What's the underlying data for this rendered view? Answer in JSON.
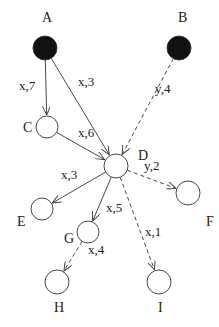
{
  "diagram": {
    "nodes": [
      {
        "id": "A",
        "label": "A",
        "filled": true
      },
      {
        "id": "B",
        "label": "B",
        "filled": true
      },
      {
        "id": "C",
        "label": "C",
        "filled": false
      },
      {
        "id": "D",
        "label": "D",
        "filled": false
      },
      {
        "id": "E",
        "label": "E",
        "filled": false
      },
      {
        "id": "F",
        "label": "F",
        "filled": false
      },
      {
        "id": "G",
        "label": "G",
        "filled": false
      },
      {
        "id": "H",
        "label": "H",
        "filled": false
      },
      {
        "id": "I",
        "label": "I",
        "filled": false
      }
    ],
    "edges": [
      {
        "from": "A",
        "to": "C",
        "label": "x,7",
        "style": "solid"
      },
      {
        "from": "A",
        "to": "D",
        "label": "x,3",
        "style": "solid"
      },
      {
        "from": "B",
        "to": "D",
        "label": "y,4",
        "style": "dashed"
      },
      {
        "from": "C",
        "to": "D",
        "label": "x,6",
        "style": "solid"
      },
      {
        "from": "D",
        "to": "E",
        "label": "x,3",
        "style": "solid"
      },
      {
        "from": "D",
        "to": "F",
        "label": "y,2",
        "style": "dashed"
      },
      {
        "from": "D",
        "to": "G",
        "label": "x,5",
        "style": "solid"
      },
      {
        "from": "D",
        "to": "I",
        "label": "x,1",
        "style": "dashed"
      },
      {
        "from": "G",
        "to": "H",
        "label": "x,4",
        "style": "dashed"
      }
    ],
    "colors": {
      "stroke": "#333333",
      "fill": "#111111",
      "background": "#ffffff"
    }
  }
}
